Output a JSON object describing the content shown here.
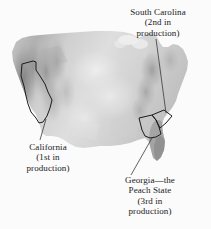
{
  "figure": {
    "background_color": "#fbfbfb",
    "text_color": "#1a1a1a"
  },
  "map": {
    "name": "united-states-relief-map",
    "terrain_light": "#e6e6e6",
    "terrain_mid": "#bcbcbc",
    "terrain_dark": "#8e8e8e",
    "outline_color": "#1c1c1c",
    "leader_line_color": "#3a3a3a"
  },
  "annotations": [
    {
      "id": "south-carolina",
      "lines": [
        "South Carolina",
        "(2nd in",
        "production)"
      ],
      "state": "South Carolina",
      "rank": "2nd in production"
    },
    {
      "id": "california",
      "lines": [
        "California",
        "(1st in",
        "production)"
      ],
      "state": "California",
      "rank": "1st in production"
    },
    {
      "id": "georgia",
      "lines": [
        "Georgia—the",
        "Peach State",
        "(3rd in",
        "production)"
      ],
      "state": "Georgia",
      "nickname": "the Peach State",
      "rank": "3rd in production"
    }
  ],
  "highlighted_states": [
    "California",
    "South Carolina",
    "Georgia"
  ]
}
